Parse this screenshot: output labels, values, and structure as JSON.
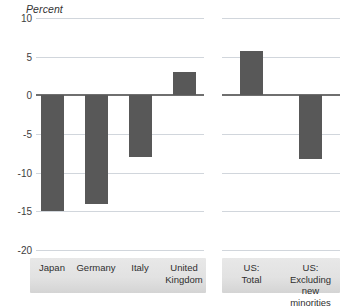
{
  "chart_data": {
    "type": "bar",
    "title": "",
    "subtitle": "",
    "ylabel": "Percent",
    "xlabel": "",
    "ylim": [
      -20,
      10
    ],
    "yticks": [
      10,
      5,
      0,
      -5,
      -10,
      -15,
      -20
    ],
    "ytick_labels": [
      "10",
      "5",
      "0",
      "-5",
      "-10",
      "-15",
      "-20"
    ],
    "grid": true,
    "legend": "none",
    "bar_color": "#585858",
    "panels": [
      {
        "name": "other-countries",
        "categories": [
          "Japan",
          "Germany",
          "Italy",
          "United\nKingdom"
        ],
        "values": [
          -15.0,
          -14.0,
          -8.0,
          3.0
        ]
      },
      {
        "name": "united-states",
        "categories": [
          "US:\nTotal",
          "US: Excluding\nnew minorities"
        ],
        "values": [
          5.7,
          -8.2
        ]
      }
    ]
  },
  "axis": {
    "title": "Percent"
  },
  "colors": {
    "bar": "#585858",
    "gridline": "#c9cfd6",
    "zeroline": "#6f6f6f",
    "label_box": "#e2e2e2",
    "text": "#3a3a3a"
  }
}
